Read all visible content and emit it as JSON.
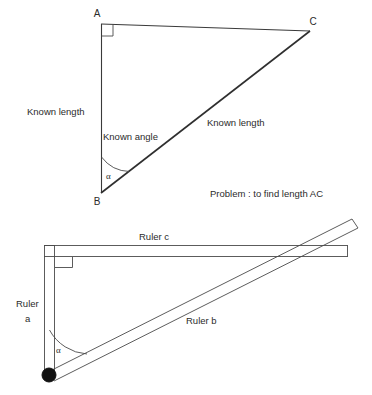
{
  "figure": {
    "background_color": "#ffffff",
    "line_color": "#3a3a3a",
    "pivot_color": "#111111",
    "top_diagram": {
      "name": "right-triangle-problem",
      "vertices": [
        {
          "id": "A",
          "label": "A",
          "x": 101,
          "y": 22
        },
        {
          "id": "C",
          "label": "C",
          "x": 310,
          "y": 30
        },
        {
          "id": "B",
          "label": "B",
          "x": 101,
          "y": 193
        }
      ],
      "right_angle_at": "A",
      "angle_marker": {
        "label": "α",
        "at_vertex": "B"
      },
      "side_labels": {
        "ab": "Known length",
        "bc": "Known length",
        "angle": "Known angle"
      },
      "problem_statement": "Problem :  to  find length AC"
    },
    "bottom_diagram": {
      "name": "ruler-linkage",
      "rulers": [
        {
          "id": "a",
          "label_line1": "Ruler",
          "label_line2": "a",
          "orientation": "vertical"
        },
        {
          "id": "b",
          "label": "Ruler b",
          "orientation": "diagonal"
        },
        {
          "id": "c",
          "label": "Ruler c",
          "orientation": "horizontal"
        }
      ],
      "angle_marker": {
        "label": "α"
      },
      "pivot": {
        "name": "pivot-joint",
        "x": 48,
        "y": 375,
        "r": 7
      },
      "right_angle_marker": true
    }
  }
}
